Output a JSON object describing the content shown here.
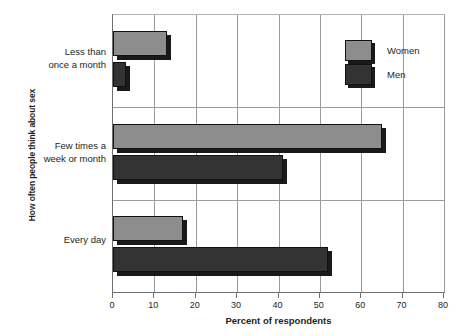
{
  "chart_data": {
    "type": "bar",
    "orientation": "horizontal",
    "title": "",
    "xlabel": "Percent of respondents",
    "ylabel": "How often people think about sex",
    "categories": [
      "Less than once a month",
      "Few times a week or month",
      "Every day"
    ],
    "series": [
      {
        "name": "Women",
        "color": "#8d8d8d",
        "values": [
          14,
          66,
          18
        ]
      },
      {
        "name": "Men",
        "color": "#333333",
        "values": [
          4,
          42,
          53
        ]
      }
    ],
    "xlim": [
      0,
      80
    ],
    "xticks": [
      0,
      10,
      20,
      30,
      40,
      50,
      60,
      70,
      80
    ],
    "xtick_labels": [
      "0",
      "10",
      "20",
      "30",
      "40",
      "50",
      "60",
      "70",
      "80"
    ],
    "grid": "vertical",
    "legend_position": "top-right"
  },
  "axes": {
    "y_title": "How often people think about sex",
    "x_title": "Percent of respondents",
    "category_labels": [
      {
        "line1": "Less than",
        "line2": "once a month"
      },
      {
        "line1": "Few times a",
        "line2": "week or month"
      },
      {
        "line1": "Every day",
        "line2": ""
      }
    ]
  },
  "legend": {
    "items": [
      {
        "label": "Women",
        "color": "#8d8d8d"
      },
      {
        "label": "Men",
        "color": "#333333"
      }
    ]
  }
}
